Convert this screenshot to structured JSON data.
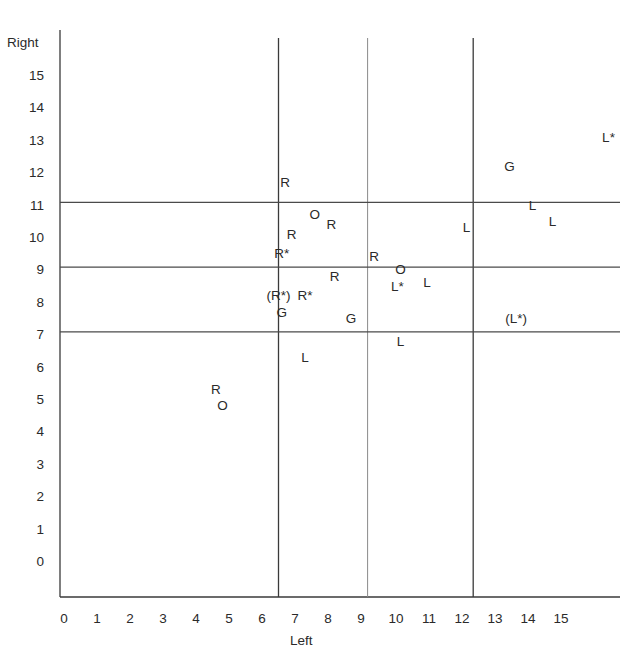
{
  "chart_data": {
    "type": "scatter",
    "title": "",
    "xlabel": "Left",
    "ylabel": "Right",
    "xlim": [
      0,
      17
    ],
    "ylim": [
      -1,
      16.5
    ],
    "x_ticks": [
      "0",
      "1",
      "2",
      "3",
      "4",
      "5",
      "6",
      "7",
      "8",
      "9",
      "10",
      "11",
      "12",
      "13",
      "14",
      "15"
    ],
    "y_ticks": [
      "15",
      "14",
      "13",
      "12",
      "11",
      "10",
      "9",
      "8",
      "7",
      "6",
      "5",
      "4",
      "3",
      "2",
      "1",
      "0"
    ],
    "grid": false,
    "reference_lines": {
      "vertical": [
        {
          "x": 6.5,
          "style": "dark"
        },
        {
          "x": 9.2,
          "style": "light"
        },
        {
          "x": 12.4,
          "style": "dark"
        }
      ],
      "horizontal": [
        {
          "y": 11.1
        },
        {
          "y": 9.1
        },
        {
          "y": 7.1
        }
      ]
    },
    "legend": null,
    "points": [
      {
        "label": "L*",
        "x": 16.5,
        "y": 13.1
      },
      {
        "label": "G",
        "x": 13.5,
        "y": 12.2
      },
      {
        "label": "R",
        "x": 6.7,
        "y": 11.7
      },
      {
        "label": "L",
        "x": 14.2,
        "y": 11.0
      },
      {
        "label": "O",
        "x": 7.6,
        "y": 10.7
      },
      {
        "label": "L",
        "x": 14.8,
        "y": 10.5
      },
      {
        "label": "R",
        "x": 8.1,
        "y": 10.4
      },
      {
        "label": "L",
        "x": 12.2,
        "y": 10.3
      },
      {
        "label": "R",
        "x": 6.9,
        "y": 10.1
      },
      {
        "label": "R*",
        "x": 6.6,
        "y": 9.5
      },
      {
        "label": "R",
        "x": 9.4,
        "y": 9.4
      },
      {
        "label": "O",
        "x": 10.2,
        "y": 9.0
      },
      {
        "label": "R",
        "x": 8.2,
        "y": 8.8
      },
      {
        "label": "L",
        "x": 11.0,
        "y": 8.6
      },
      {
        "label": "L*",
        "x": 10.1,
        "y": 8.5
      },
      {
        "label": "(R*)",
        "x": 6.5,
        "y": 8.2
      },
      {
        "label": "R*",
        "x": 7.3,
        "y": 8.2
      },
      {
        "label": "G",
        "x": 6.6,
        "y": 7.7
      },
      {
        "label": "G",
        "x": 8.7,
        "y": 7.5
      },
      {
        "label": "(L*)",
        "x": 13.7,
        "y": 7.5
      },
      {
        "label": "L",
        "x": 10.2,
        "y": 6.8
      },
      {
        "label": "L",
        "x": 7.3,
        "y": 6.3
      },
      {
        "label": "R",
        "x": 4.6,
        "y": 5.3
      },
      {
        "label": "O",
        "x": 4.8,
        "y": 4.8
      }
    ]
  }
}
